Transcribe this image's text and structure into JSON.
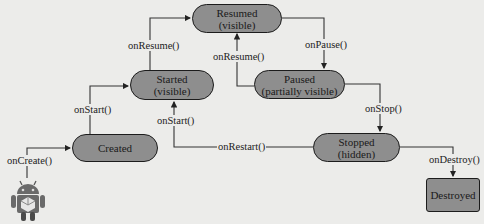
{
  "diagram": {
    "nodes": [
      {
        "id": "resumed",
        "label": "Resumed",
        "sublabel": "(visible)"
      },
      {
        "id": "started",
        "label": "Started",
        "sublabel": "(visible)"
      },
      {
        "id": "paused",
        "label": "Paused",
        "sublabel": "(partially visible)"
      },
      {
        "id": "created",
        "label": "Created",
        "sublabel": ""
      },
      {
        "id": "stopped",
        "label": "Stopped",
        "sublabel": "(hidden)"
      },
      {
        "id": "destroyed",
        "label": "Destroyed",
        "sublabel": ""
      }
    ],
    "edges": [
      {
        "from": "start",
        "to": "created",
        "label": "onCreate()"
      },
      {
        "from": "created",
        "to": "started",
        "label": "onStart()"
      },
      {
        "from": "started",
        "to": "resumed",
        "label": "onResume()"
      },
      {
        "from": "resumed",
        "to": "paused",
        "label": "onPause()"
      },
      {
        "from": "paused",
        "to": "resumed",
        "label": "onResume()"
      },
      {
        "from": "paused",
        "to": "stopped",
        "label": "onStop()"
      },
      {
        "from": "stopped",
        "to": "started",
        "label": "onRestart()"
      },
      {
        "from": "restart",
        "to": "started",
        "label": "onStart()"
      },
      {
        "from": "stopped",
        "to": "destroyed",
        "label": "onDestroy()"
      }
    ],
    "start_icon": "android-robot-icon",
    "colors": {
      "node_fill": "#8e8e8e",
      "node_border": "#1c1c1c",
      "background": "#ececea",
      "line": "#333333"
    }
  }
}
